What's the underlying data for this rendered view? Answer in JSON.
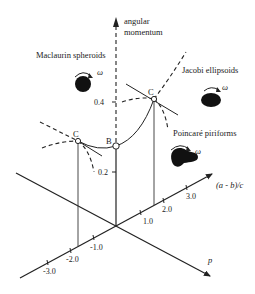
{
  "figure": {
    "axes": {
      "vertical": {
        "label_line1": "angular",
        "label_line2": "momentum",
        "ticks": [
          "0.4",
          "0.2"
        ]
      },
      "ab_axis": {
        "label": "(a - b)/c",
        "ticks": [
          "1.0",
          "2.0",
          "3.0"
        ],
        "negative_ticks": [
          "-1.0",
          "-2.0",
          "-3.0"
        ]
      },
      "p_axis": {
        "label": "p"
      }
    },
    "sequences": {
      "maclaurin": {
        "label": "Maclaurin spheroids",
        "omega": "ω"
      },
      "jacobi": {
        "label": "Jacobi ellipsoids",
        "omega": "ω"
      },
      "poincare": {
        "label": "Poincaré piriforms",
        "omega": "ω"
      }
    },
    "points": {
      "left_c": "C",
      "b": "B",
      "right_c": "C"
    }
  }
}
